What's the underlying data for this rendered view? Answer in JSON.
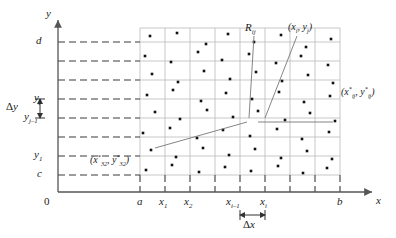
{
  "figure": {
    "axes": {
      "x_axis_label": "x",
      "y_axis_label": "y",
      "origin_label": "0"
    },
    "x_ticks": [
      {
        "id": "a",
        "label_main": "a",
        "label_sub": "",
        "x": 140
      },
      {
        "id": "x1",
        "label_main": "x",
        "label_sub": "1",
        "x": 165
      },
      {
        "id": "x2",
        "label_main": "x",
        "label_sub": "2",
        "x": 190
      },
      {
        "id": "x3",
        "label_main": "",
        "label_sub": "",
        "x": 215
      },
      {
        "id": "xi-1",
        "label_main": "x",
        "label_sub": "i–1",
        "x": 240
      },
      {
        "id": "xi",
        "label_main": "x",
        "label_sub": "i",
        "x": 265
      },
      {
        "id": "x6",
        "label_main": "",
        "label_sub": "",
        "x": 290
      },
      {
        "id": "x7",
        "label_main": "",
        "label_sub": "",
        "x": 315
      },
      {
        "id": "b",
        "label_main": "b",
        "label_sub": "",
        "x": 340
      }
    ],
    "y_ticks": [
      {
        "id": "d",
        "label_main": "d",
        "label_sub": "",
        "y": 42
      },
      {
        "id": "y5",
        "label_main": "",
        "label_sub": "",
        "y": 61
      },
      {
        "id": "y4",
        "label_main": "",
        "label_sub": "",
        "y": 80
      },
      {
        "id": "yj",
        "label_main": "y",
        "label_sub": "j",
        "y": 99
      },
      {
        "id": "yj-1",
        "label_main": "y",
        "label_sub": "j–1",
        "y": 118
      },
      {
        "id": "y2",
        "label_main": "",
        "label_sub": "",
        "y": 137
      },
      {
        "id": "y1",
        "label_main": "y",
        "label_sub": "1",
        "y": 156
      },
      {
        "id": "c",
        "label_main": "c",
        "label_sub": "",
        "y": 175
      }
    ],
    "annotations": {
      "delta_y": {
        "symbol": "Δ",
        "var": "y"
      },
      "delta_x": {
        "symbol": "Δ",
        "var": "x"
      },
      "subrectangle": {
        "main": "R",
        "sub": "ij"
      },
      "corner_point": {
        "text": "(x",
        "sub1": "i",
        "mid": ", y",
        "sub2": "j",
        "close": ")"
      },
      "sample_point": {
        "text": "(x",
        "sup1": "*",
        "sub1": "ij",
        "mid": ", y",
        "sup2": "*",
        "sub2": "ij",
        "close": ")"
      },
      "sample_point_32": {
        "text": "(x",
        "sup1": "*",
        "sub1": "32",
        "mid": ", y",
        "sup2": "*",
        "sub2": "32",
        "close": ")"
      }
    },
    "colors": {
      "ink": "#1a1a1a",
      "axis": "#555555",
      "grid": "#b9b9b9",
      "dashed": "#3a3a3a",
      "dot": "#111111"
    },
    "sample_dots": [
      [
        150,
        36
      ],
      [
        177,
        33
      ],
      [
        206,
        44
      ],
      [
        228,
        34
      ],
      [
        254,
        42
      ],
      [
        281,
        35
      ],
      [
        306,
        47
      ],
      [
        331,
        39
      ],
      [
        145,
        56
      ],
      [
        171,
        62
      ],
      [
        198,
        52
      ],
      [
        222,
        60
      ],
      [
        249,
        54
      ],
      [
        276,
        63
      ],
      [
        301,
        56
      ],
      [
        328,
        65
      ],
      [
        152,
        74
      ],
      [
        178,
        82
      ],
      [
        204,
        71
      ],
      [
        230,
        79
      ],
      [
        256,
        72
      ],
      [
        282,
        81
      ],
      [
        308,
        75
      ],
      [
        333,
        83
      ],
      [
        147,
        95
      ],
      [
        173,
        90
      ],
      [
        201,
        101
      ],
      [
        226,
        93
      ],
      [
        252,
        99
      ],
      [
        279,
        92
      ],
      [
        304,
        102
      ],
      [
        330,
        96
      ],
      [
        155,
        112
      ],
      [
        180,
        119
      ],
      [
        207,
        110
      ],
      [
        233,
        117
      ],
      [
        258,
        111
      ],
      [
        285,
        120
      ],
      [
        310,
        113
      ],
      [
        335,
        121
      ],
      [
        143,
        133
      ],
      [
        170,
        128
      ],
      [
        197,
        138
      ],
      [
        223,
        130
      ],
      [
        250,
        136
      ],
      [
        277,
        129
      ],
      [
        302,
        139
      ],
      [
        329,
        132
      ],
      [
        151,
        150
      ],
      [
        176,
        157
      ],
      [
        203,
        148
      ],
      [
        229,
        155
      ],
      [
        255,
        149
      ],
      [
        281,
        158
      ],
      [
        307,
        151
      ],
      [
        332,
        159
      ],
      [
        146,
        170
      ],
      [
        172,
        165
      ],
      [
        199,
        172
      ],
      [
        225,
        167
      ],
      [
        251,
        171
      ],
      [
        278,
        166
      ],
      [
        303,
        173
      ],
      [
        327,
        168
      ]
    ],
    "leader_lines": {
      "Rij_from": [
        254,
        36
      ],
      "Rij_to": [
        249,
        118
      ],
      "corner_from": [
        297,
        36
      ],
      "corner_to": [
        265,
        118
      ],
      "sample_from": [
        333,
        122
      ],
      "sample_to": [
        258,
        122
      ],
      "sample32_from": [
        155,
        148
      ],
      "sample32_to": [
        247,
        122
      ]
    }
  }
}
